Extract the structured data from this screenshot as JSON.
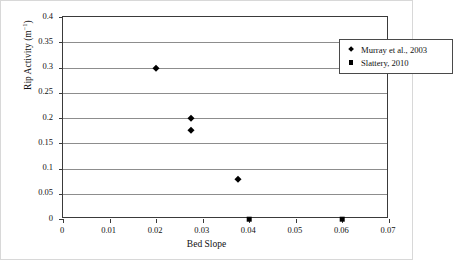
{
  "chart_data": {
    "type": "scatter",
    "title": "",
    "xlabel": "Bed Slope",
    "ylabel": "Rip Activity (m-1)",
    "ylabel_base": "Rip Activity (m",
    "ylabel_exponent": "−1",
    "ylabel_tail": ")",
    "xlim": [
      0,
      0.07
    ],
    "ylim": [
      0,
      0.4
    ],
    "xticks": [
      "0",
      "0.01",
      "0.02",
      "0.03",
      "0.04",
      "0.05",
      "0.06",
      "0.07"
    ],
    "xtick_values": [
      0,
      0.01,
      0.02,
      0.03,
      0.04,
      0.05,
      0.06,
      0.07
    ],
    "yticks": [
      "0",
      "0.05",
      "0.1",
      "0.15",
      "0.2",
      "0.25",
      "0.3",
      "0.35",
      "0.4"
    ],
    "ytick_values": [
      0,
      0.05,
      0.1,
      0.15,
      0.2,
      0.25,
      0.3,
      0.35,
      0.4
    ],
    "grid": "horizontal",
    "legend_position": "top-right",
    "marker_color": "#000000",
    "gridline_color": "#8d8d8d",
    "axis_color": "#3a3a3a",
    "series": [
      {
        "name": "Murray et al., 2003",
        "marker": "diamond",
        "points": [
          {
            "x": 0.02,
            "y": 0.3
          },
          {
            "x": 0.0275,
            "y": 0.2
          },
          {
            "x": 0.0275,
            "y": 0.177
          },
          {
            "x": 0.0375,
            "y": 0.08
          }
        ]
      },
      {
        "name": "Slattery, 2010",
        "marker": "square",
        "points": [
          {
            "x": 0.04,
            "y": 0.0
          },
          {
            "x": 0.06,
            "y": 0.0
          }
        ]
      }
    ]
  }
}
